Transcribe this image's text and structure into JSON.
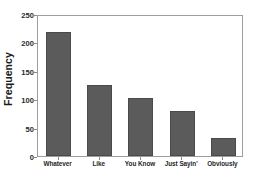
{
  "chart_data": {
    "type": "bar",
    "title": "",
    "subtitle": "",
    "xlabel": "",
    "ylabel": "Frequency",
    "categories": [
      "Whatever",
      "Like",
      "You Know",
      "Just Sayin'",
      "Obviously"
    ],
    "values": [
      218,
      125,
      102,
      79,
      31
    ],
    "ylim": [
      0,
      250
    ],
    "yticks": [
      0,
      50,
      100,
      150,
      200,
      250
    ],
    "ytick_labels": [
      "0",
      "50",
      "100",
      "150",
      "200",
      "250"
    ],
    "grid": false,
    "legend": null,
    "legend_position": "none",
    "series": [
      {
        "name": "Frequency",
        "values": [
          218,
          125,
          102,
          79,
          31
        ]
      }
    ],
    "colors": {
      "bar_fill": "#5b5b5b",
      "bar_edge": "#4a4a4a",
      "plot_background": "#ffffff",
      "frame": "#9e9e9e",
      "text": "#1a1a1a",
      "tick": "#8a8a8a"
    }
  }
}
